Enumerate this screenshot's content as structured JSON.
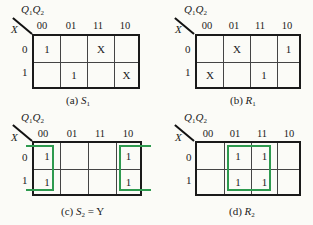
{
  "maps": [
    {
      "id": "a",
      "caption_prefix": "(a) ",
      "caption_var": "S",
      "caption_sub": "1",
      "caption_suffix": "",
      "col_var_label": "Q1Q2",
      "row_var_label": "X",
      "col_headers": [
        "00",
        "01",
        "11",
        "10"
      ],
      "row_headers": [
        "0",
        "1"
      ],
      "cells": [
        [
          "1",
          "",
          "X",
          ""
        ],
        [
          "",
          "1",
          "",
          "X"
        ]
      ],
      "groups": []
    },
    {
      "id": "b",
      "caption_prefix": "(b) ",
      "caption_var": "R",
      "caption_sub": "1",
      "caption_suffix": "",
      "col_var_label": "Q1Q2",
      "row_var_label": "X",
      "col_headers": [
        "00",
        "01",
        "11",
        "10"
      ],
      "row_headers": [
        "0",
        "1"
      ],
      "cells": [
        [
          "",
          "X",
          "",
          "1"
        ],
        [
          "X",
          "",
          "1",
          ""
        ]
      ],
      "groups": []
    },
    {
      "id": "c",
      "caption_prefix": "(c) ",
      "caption_var": "S",
      "caption_sub": "2",
      "caption_suffix": " = Y",
      "col_var_label": "Q1Q2",
      "row_var_label": "X",
      "col_headers": [
        "00",
        "01",
        "11",
        "10"
      ],
      "row_headers": [
        "0",
        "1"
      ],
      "cells": [
        [
          "1",
          "",
          "",
          "1"
        ],
        [
          "1",
          "",
          "",
          "1"
        ]
      ],
      "groups": [
        {
          "cols": [
            "00",
            "10"
          ],
          "rows": [
            "0",
            "1"
          ],
          "wraparound": true,
          "color": "#2e9a4f"
        }
      ]
    },
    {
      "id": "d",
      "caption_prefix": "(d) ",
      "caption_var": "R",
      "caption_sub": "2",
      "caption_suffix": "",
      "col_var_label": "Q1Q2",
      "row_var_label": "X",
      "col_headers": [
        "00",
        "01",
        "11",
        "10"
      ],
      "row_headers": [
        "0",
        "1"
      ],
      "cells": [
        [
          "",
          "1",
          "1",
          ""
        ],
        [
          "",
          "1",
          "1",
          ""
        ]
      ],
      "groups": [
        {
          "cols": [
            "01",
            "11"
          ],
          "rows": [
            "0",
            "1"
          ],
          "wraparound": false,
          "color": "#2e9a4f"
        }
      ]
    }
  ],
  "colors": {
    "group": "#2e9a4f",
    "grid": "#1a1a1a",
    "background": "#fbfbf7"
  }
}
